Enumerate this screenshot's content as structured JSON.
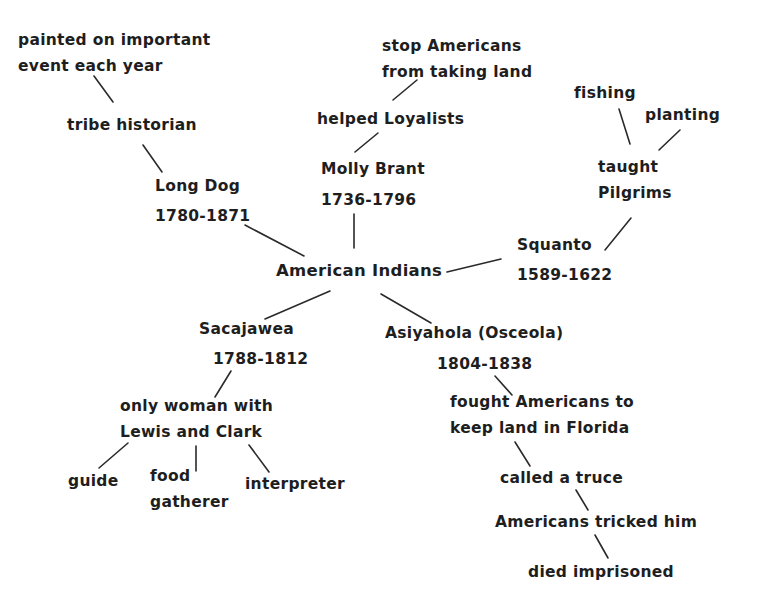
{
  "diagram": {
    "center": {
      "id": "american-indians",
      "label": "American Indians",
      "x": 276,
      "y": 258
    },
    "nodes": [
      {
        "id": "painted",
        "lines": [
          "painted on important",
          "event each year"
        ],
        "x": 18,
        "y": 27
      },
      {
        "id": "tribe-historian",
        "lines": [
          "tribe historian"
        ],
        "x": 67,
        "y": 112
      },
      {
        "id": "long-dog",
        "lines": [
          "Long Dog"
        ],
        "x": 155,
        "y": 173
      },
      {
        "id": "long-dog-dates",
        "lines": [
          "1780-1871"
        ],
        "x": 155,
        "y": 203
      },
      {
        "id": "stop-americans",
        "lines": [
          "stop Americans",
          "from taking land"
        ],
        "x": 382,
        "y": 33
      },
      {
        "id": "helped-loyalists",
        "lines": [
          "helped Loyalists"
        ],
        "x": 317,
        "y": 106
      },
      {
        "id": "molly-brant",
        "lines": [
          "Molly Brant"
        ],
        "x": 321,
        "y": 156
      },
      {
        "id": "molly-brant-dates",
        "lines": [
          "1736-1796"
        ],
        "x": 321,
        "y": 187
      },
      {
        "id": "fishing",
        "lines": [
          "fishing"
        ],
        "x": 574,
        "y": 80
      },
      {
        "id": "planting",
        "lines": [
          "planting"
        ],
        "x": 645,
        "y": 102
      },
      {
        "id": "taught-pilgrims",
        "lines": [
          "taught",
          "Pilgrims"
        ],
        "x": 598,
        "y": 154
      },
      {
        "id": "squanto",
        "lines": [
          "Squanto"
        ],
        "x": 517,
        "y": 232
      },
      {
        "id": "squanto-dates",
        "lines": [
          "1589-1622"
        ],
        "x": 517,
        "y": 262
      },
      {
        "id": "sacajawea",
        "lines": [
          "Sacajawea"
        ],
        "x": 199,
        "y": 316
      },
      {
        "id": "sacajawea-dates",
        "lines": [
          "1788-1812"
        ],
        "x": 213,
        "y": 346
      },
      {
        "id": "asiyahola",
        "lines": [
          "Asiyahola (Osceola)"
        ],
        "x": 385,
        "y": 320
      },
      {
        "id": "asiyahola-dates",
        "lines": [
          "1804-1838"
        ],
        "x": 437,
        "y": 351
      },
      {
        "id": "only-woman",
        "lines": [
          "only woman with",
          "Lewis and Clark"
        ],
        "x": 120,
        "y": 393
      },
      {
        "id": "guide",
        "lines": [
          "guide"
        ],
        "x": 68,
        "y": 468
      },
      {
        "id": "food-gatherer",
        "lines": [
          "food",
          "gatherer"
        ],
        "x": 150,
        "y": 463
      },
      {
        "id": "interpreter",
        "lines": [
          "interpreter"
        ],
        "x": 245,
        "y": 471
      },
      {
        "id": "fought-americans",
        "lines": [
          "fought Americans to",
          "keep land in Florida"
        ],
        "x": 450,
        "y": 389
      },
      {
        "id": "called-truce",
        "lines": [
          "called a truce"
        ],
        "x": 500,
        "y": 465
      },
      {
        "id": "tricked",
        "lines": [
          "Americans tricked him"
        ],
        "x": 495,
        "y": 509
      },
      {
        "id": "died",
        "lines": [
          "died imprisoned"
        ],
        "x": 528,
        "y": 559
      }
    ],
    "links": [
      {
        "from": "painted",
        "to": "tribe-historian",
        "x1": 94,
        "y1": 76,
        "x2": 113,
        "y2": 102
      },
      {
        "from": "tribe-historian",
        "to": "long-dog",
        "x1": 143,
        "y1": 145,
        "x2": 162,
        "y2": 172
      },
      {
        "from": "long-dog-dates",
        "to": "american-indians",
        "x1": 245,
        "y1": 225,
        "x2": 304,
        "y2": 256
      },
      {
        "from": "stop-americans",
        "to": "helped-loyalists",
        "x1": 417,
        "y1": 80,
        "x2": 393,
        "y2": 100
      },
      {
        "from": "helped-loyalists",
        "to": "molly-brant",
        "x1": 378,
        "y1": 133,
        "x2": 355,
        "y2": 152
      },
      {
        "from": "molly-brant-dates",
        "to": "american-indians",
        "x1": 354,
        "y1": 214,
        "x2": 354,
        "y2": 248
      },
      {
        "from": "fishing",
        "to": "taught-pilgrims",
        "x1": 619,
        "y1": 109,
        "x2": 630,
        "y2": 144
      },
      {
        "from": "planting",
        "to": "taught-pilgrims",
        "x1": 680,
        "y1": 130,
        "x2": 659,
        "y2": 150
      },
      {
        "from": "taught-pilgrims",
        "to": "squanto",
        "x1": 631,
        "y1": 218,
        "x2": 605,
        "y2": 250
      },
      {
        "from": "american-indians",
        "to": "squanto",
        "x1": 447,
        "y1": 272,
        "x2": 501,
        "y2": 259
      },
      {
        "from": "american-indians",
        "to": "sacajawea",
        "x1": 330,
        "y1": 291,
        "x2": 265,
        "y2": 319
      },
      {
        "from": "american-indians",
        "to": "asiyahola",
        "x1": 381,
        "y1": 294,
        "x2": 431,
        "y2": 323
      },
      {
        "from": "sacajawea-dates",
        "to": "only-woman",
        "x1": 231,
        "y1": 371,
        "x2": 215,
        "y2": 397
      },
      {
        "from": "only-woman",
        "to": "guide",
        "x1": 128,
        "y1": 443,
        "x2": 99,
        "y2": 468
      },
      {
        "from": "only-woman",
        "to": "food-gatherer",
        "x1": 196,
        "y1": 446,
        "x2": 196,
        "y2": 471
      },
      {
        "from": "only-woman",
        "to": "interpreter",
        "x1": 249,
        "y1": 445,
        "x2": 269,
        "y2": 472
      },
      {
        "from": "asiyahola-dates",
        "to": "fought-americans",
        "x1": 495,
        "y1": 376,
        "x2": 512,
        "y2": 395
      },
      {
        "from": "fought-americans",
        "to": "called-truce",
        "x1": 515,
        "y1": 442,
        "x2": 530,
        "y2": 466
      },
      {
        "from": "called-truce",
        "to": "tricked",
        "x1": 576,
        "y1": 490,
        "x2": 588,
        "y2": 510
      },
      {
        "from": "tricked",
        "to": "died",
        "x1": 595,
        "y1": 535,
        "x2": 608,
        "y2": 558
      }
    ],
    "colors": {
      "background": "#ffffff",
      "text": "#1e1e1e",
      "line": "#2a2a2a"
    }
  }
}
